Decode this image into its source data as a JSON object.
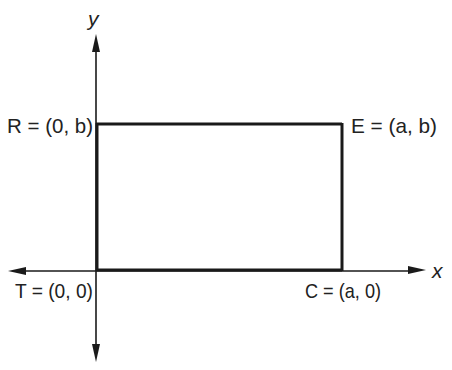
{
  "diagram": {
    "axes": {
      "x_label": "x",
      "y_label": "y"
    },
    "points": [
      {
        "name": "R",
        "label": "R = (0, b)",
        "letter": "R",
        "coords": "(0, b)"
      },
      {
        "name": "E",
        "label": "E = (a, b)",
        "letter": "E",
        "coords": "(a, b)"
      },
      {
        "name": "T",
        "label": "T = (0, 0)",
        "letter": "T",
        "coords": "(0, 0)"
      },
      {
        "name": "C",
        "label": "C = (a, 0)",
        "letter": "C",
        "coords": "(a, 0)"
      }
    ],
    "shape": "rectangle TCER",
    "colors": {
      "line": "#1a1a1a",
      "text": "#222222",
      "background": "#ffffff"
    }
  }
}
